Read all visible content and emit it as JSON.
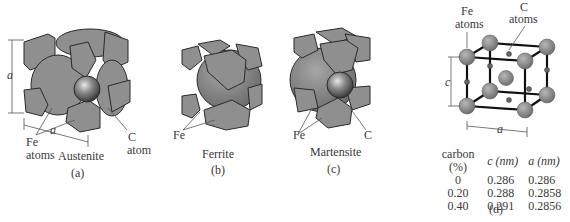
{
  "figure": {
    "panels": [
      {
        "id": "a",
        "caption": "(a)",
        "name": "Austenite",
        "labels": {
          "fe": "Fe",
          "fe2": "atoms",
          "c": "C",
          "c2": "atom",
          "dim_vertical": "a",
          "dim_horizontal": "a"
        }
      },
      {
        "id": "b",
        "caption": "(b)",
        "name": "Ferrite",
        "labels": {
          "fe": "Fe"
        }
      },
      {
        "id": "c",
        "caption": "(c)",
        "name": "Martensite",
        "labels": {
          "fe": "Fe",
          "c": "C"
        }
      },
      {
        "id": "d",
        "caption": "(d)",
        "labels": {
          "fe": "Fe",
          "fe2": "atoms",
          "c": "C",
          "c2": "atoms",
          "dim_vertical": "c",
          "dim_horizontal": "a"
        }
      }
    ],
    "table": {
      "headers": [
        "carbon (%)",
        "c (nm)",
        "a (nm)"
      ],
      "rows": [
        [
          "0",
          "0.286",
          "0.286"
        ],
        [
          "0.20",
          "0.288",
          "0.2858"
        ],
        [
          "0.40",
          "0.291",
          "0.2856"
        ]
      ]
    },
    "colors": {
      "atom_gray": "#8a8a8a",
      "edge": "#2a2a2a",
      "background": "#ffffff"
    }
  }
}
